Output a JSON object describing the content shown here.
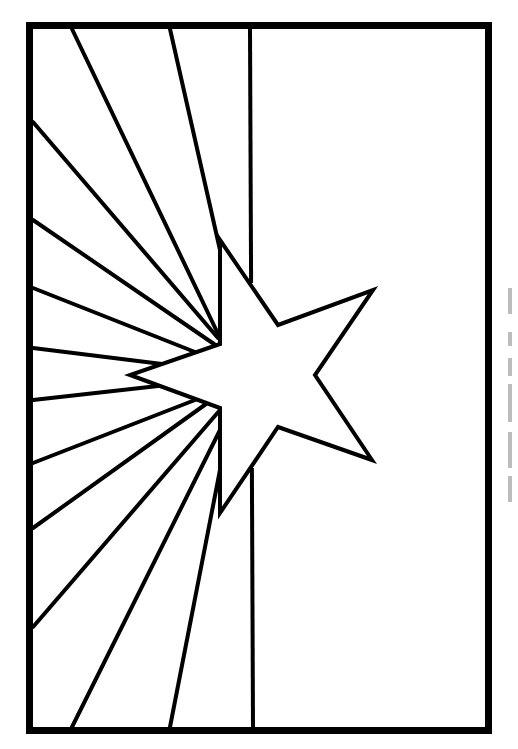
{
  "page": {
    "background": "#ffffff",
    "stroke_color": "#000000"
  },
  "frame": {
    "x": 29.5,
    "y": 25.5,
    "width": 459,
    "height": 705,
    "stroke_width": 7
  },
  "divider": {
    "top": [
      250,
      29
    ],
    "bottom": [
      253,
      727
    ],
    "star_gap_top": 283,
    "star_gap_bottom": 468
  },
  "star": {
    "points": [
      [
        220,
        240
      ],
      [
        278,
        325
      ],
      [
        373,
        290
      ],
      [
        315,
        375
      ],
      [
        372,
        460
      ],
      [
        278,
        427
      ],
      [
        220,
        513
      ],
      [
        220,
        408
      ],
      [
        130,
        375
      ],
      [
        220,
        344
      ]
    ]
  },
  "rays": [
    {
      "from": [
        72,
        29
      ],
      "to": [
        220,
        338
      ]
    },
    {
      "from": [
        170,
        29
      ],
      "to": [
        220,
        250
      ]
    },
    {
      "from": [
        33,
        122
      ],
      "to": [
        218,
        338
      ]
    },
    {
      "from": [
        33,
        220
      ],
      "to": [
        214,
        344
      ]
    },
    {
      "from": [
        33,
        288
      ],
      "to": [
        195,
        352
      ]
    },
    {
      "from": [
        33,
        348
      ],
      "to": [
        162,
        364
      ]
    },
    {
      "from": [
        33,
        400
      ],
      "to": [
        158,
        386
      ]
    },
    {
      "from": [
        33,
        463
      ],
      "to": [
        195,
        400
      ]
    },
    {
      "from": [
        33,
        528
      ],
      "to": [
        206,
        404
      ]
    },
    {
      "from": [
        33,
        627
      ],
      "to": [
        220,
        410
      ]
    },
    {
      "from": [
        72,
        727
      ],
      "to": [
        220,
        430
      ]
    },
    {
      "from": [
        170,
        727
      ],
      "to": [
        220,
        470
      ]
    }
  ],
  "edge_marks": [
    {
      "top": 8,
      "height": 26
    },
    {
      "top": 52,
      "height": 14
    },
    {
      "top": 78,
      "height": 18
    },
    {
      "top": 104,
      "height": 38
    },
    {
      "top": 152,
      "height": 36
    },
    {
      "top": 196,
      "height": 26
    }
  ]
}
